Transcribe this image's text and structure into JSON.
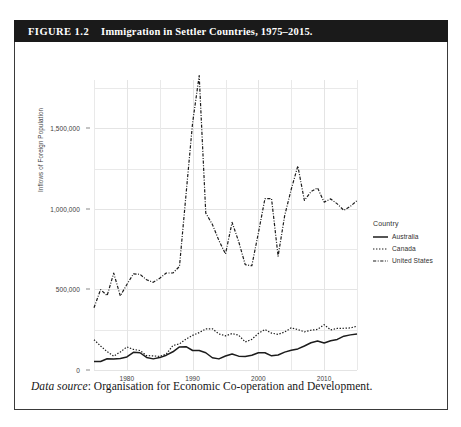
{
  "figure": {
    "number_label": "FIGURE 1.2",
    "title": "Immigration in Settler Countries, 1975–2015.",
    "source_prefix": "Data source",
    "source_text": ": Organisation for Economic Co-operation and Development."
  },
  "legend": {
    "title": "Country",
    "entries": [
      {
        "label": "Australia",
        "style": "solid",
        "color": "#1c1c1c"
      },
      {
        "label": "Canada",
        "style": "dotted",
        "color": "#1c1c1c"
      },
      {
        "label": "United States",
        "style": "dashdot",
        "color": "#1c1c1c"
      }
    ]
  },
  "axes": {
    "ylabel": "Inflows of Foreign Population",
    "yticks": [
      "0",
      "500,000",
      "1,000,000",
      "1,500,000"
    ],
    "ytick_values": [
      0,
      500000,
      1000000,
      1500000
    ],
    "xticks": [
      "1980",
      "1990",
      "2000",
      "2010"
    ],
    "xtick_values": [
      1980,
      1990,
      2000,
      2010
    ],
    "xlim": [
      1975,
      2015
    ],
    "ylim": [
      0,
      1800000
    ],
    "grid": true
  },
  "chart_data": {
    "type": "line",
    "title": "Immigration in Settler Countries, 1975–2015.",
    "xlabel": "",
    "ylabel": "Inflows of Foreign Population",
    "xlim": [
      1975,
      2015
    ],
    "ylim": [
      0,
      1800000
    ],
    "yticks": [
      0,
      500000,
      1000000,
      1500000
    ],
    "xticks": [
      1980,
      1990,
      2000,
      2010
    ],
    "grid": true,
    "legend_position": "right",
    "legend_title": "Country",
    "x": [
      1975,
      1976,
      1977,
      1978,
      1979,
      1980,
      1981,
      1982,
      1983,
      1984,
      1985,
      1986,
      1987,
      1988,
      1989,
      1990,
      1991,
      1992,
      1993,
      1994,
      1995,
      1996,
      1997,
      1998,
      1999,
      2000,
      2001,
      2002,
      2003,
      2004,
      2005,
      2006,
      2007,
      2008,
      2009,
      2010,
      2011,
      2012,
      2013,
      2014,
      2015
    ],
    "series": [
      {
        "name": "United States",
        "style": "dashdot",
        "color": "#1c1c1c",
        "values": [
          386000,
          499000,
          462000,
          601000,
          460000,
          531000,
          597000,
          594000,
          560000,
          544000,
          570000,
          602000,
          602000,
          643000,
          1091000,
          1536000,
          1827000,
          974000,
          904000,
          804000,
          720000,
          916000,
          798000,
          654000,
          647000,
          850000,
          1064000,
          1064000,
          706000,
          958000,
          1122000,
          1266000,
          1052000,
          1107000,
          1130000,
          1042000,
          1062000,
          1031000,
          991000,
          1016000,
          1051000
        ]
      },
      {
        "name": "Canada",
        "style": "dotted",
        "color": "#1c1c1c",
        "values": [
          188000,
          149000,
          114000,
          86000,
          112000,
          143000,
          128000,
          121000,
          89000,
          88000,
          84000,
          99000,
          152000,
          162000,
          192000,
          215000,
          232000,
          255000,
          256000,
          224000,
          212000,
          226000,
          216000,
          174000,
          190000,
          227000,
          251000,
          229000,
          221000,
          236000,
          262000,
          251000,
          237000,
          247000,
          252000,
          281000,
          249000,
          258000,
          259000,
          261000,
          272000
        ]
      },
      {
        "name": "Australia",
        "style": "solid",
        "color": "#1c1c1c",
        "values": [
          52000,
          53000,
          70000,
          68000,
          72000,
          81000,
          110000,
          107000,
          78000,
          69000,
          77000,
          92000,
          113000,
          143000,
          145000,
          121000,
          121000,
          107000,
          76000,
          69000,
          87000,
          99000,
          86000,
          84000,
          92000,
          107000,
          107000,
          88000,
          93000,
          111000,
          123000,
          131000,
          149000,
          169000,
          180000,
          168000,
          182000,
          190000,
          210000,
          218000,
          224000
        ]
      }
    ]
  }
}
